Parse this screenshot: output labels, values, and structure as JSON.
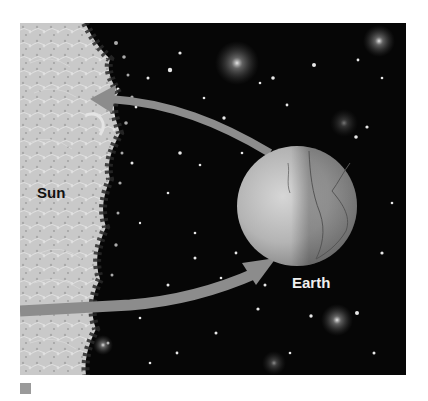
{
  "figure": {
    "labels": {
      "sun": "Sun",
      "earth": "Earth"
    },
    "arrows": [
      {
        "name": "earth-to-sun-arrow",
        "from": "Earth",
        "to": "Sun",
        "direction": "left"
      },
      {
        "name": "sun-to-earth-arrow",
        "from": "Sun",
        "to": "Earth",
        "direction": "right"
      }
    ],
    "colors": {
      "space": "#060606",
      "sun": "#c8c8c8",
      "earth": "#b5b5b5",
      "arrow": "#8c8c8c",
      "marker": "#9a9a9a"
    }
  }
}
